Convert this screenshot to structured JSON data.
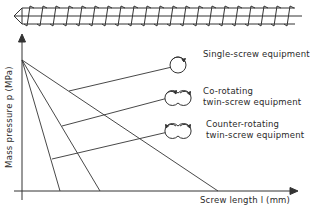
{
  "diagram": {
    "type": "pressure-profile",
    "axes": {
      "y_label": "Mass pressure  p (MPa)",
      "x_label": "Screw length  l (mm)"
    },
    "legend": [
      {
        "id": "single",
        "label_line1": "Single-screw equipment",
        "label_line2": "",
        "icon": "single-screw-cross-section-icon"
      },
      {
        "id": "co",
        "label_line1": "Co-rotating",
        "label_line2": "twin-screw equipment",
        "icon": "co-rotating-twin-screw-icon"
      },
      {
        "id": "counter",
        "label_line1": "Counter-rotating",
        "label_line2": "twin-screw equipment",
        "icon": "counter-rotating-twin-screw-icon"
      }
    ],
    "top_illustration": "extruder-screw-icon",
    "colors": {
      "line": "#333333",
      "background": "#ffffff"
    }
  }
}
